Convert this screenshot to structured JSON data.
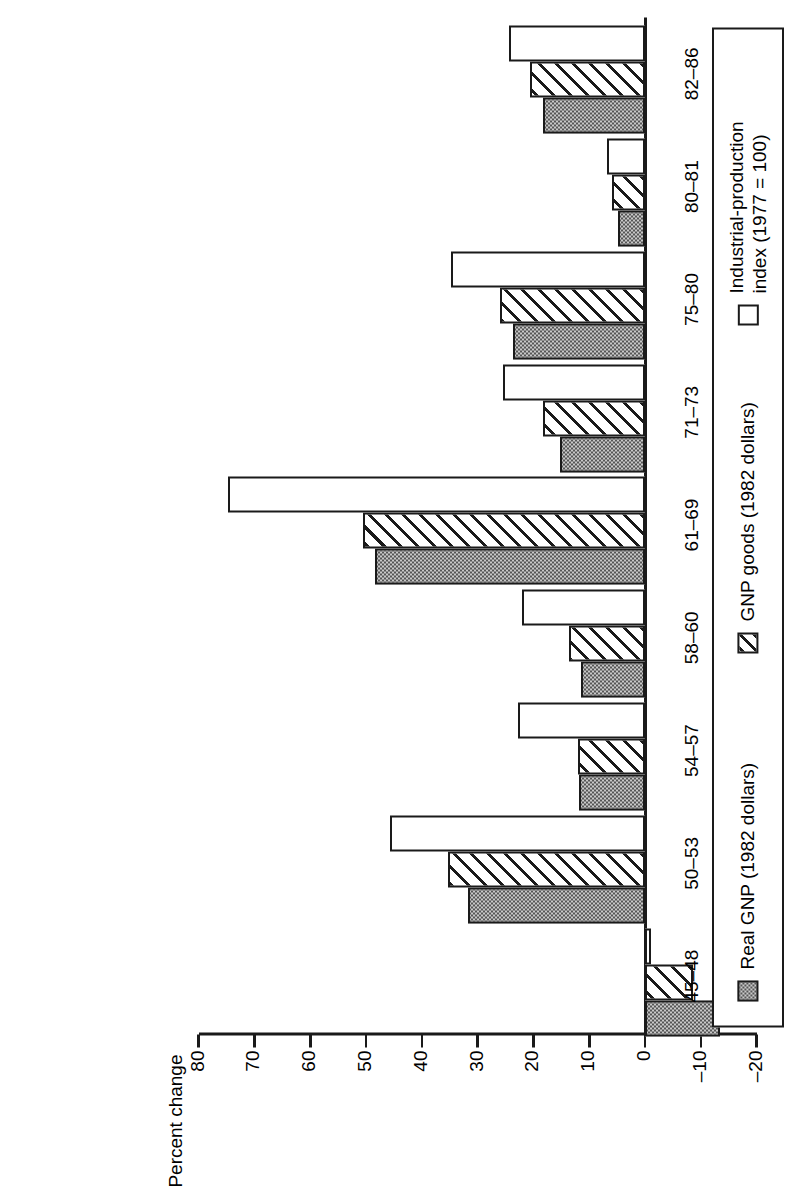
{
  "chart_data": {
    "type": "bar",
    "title": "",
    "xlabel": "",
    "ylabel": "Percent change",
    "orientation": "vertical-rotated",
    "grid": false,
    "legend_position": "right",
    "ylim": [
      -20,
      80
    ],
    "yticks": [
      80,
      70,
      60,
      50,
      40,
      30,
      20,
      10,
      0,
      "–10",
      "–20"
    ],
    "ytick_values": [
      80,
      70,
      60,
      50,
      40,
      30,
      20,
      10,
      0,
      -10,
      -20
    ],
    "categories": [
      "45–48",
      "50–53",
      "54–57",
      "58–60",
      "61–69",
      "71–73",
      "75–80",
      "80–81",
      "82–86"
    ],
    "series": [
      {
        "name": "Real GNP (1982 dollars)",
        "pattern": "dotted",
        "values": [
          -13.4,
          31.7,
          11.8,
          11.5,
          48.4,
          15.2,
          23.6,
          4.8,
          18.3
        ]
      },
      {
        "name": "GNP goods (1982 dollars)",
        "pattern": "hatched",
        "values": [
          -8.6,
          35.3,
          12.0,
          13.6,
          50.5,
          18.3,
          26.0,
          5.9,
          20.6
        ]
      },
      {
        "name": "Industrial-production index (1977 = 100)",
        "pattern": "white",
        "values": [
          -1.0,
          45.7,
          22.8,
          22.0,
          74.7,
          25.5,
          34.8,
          6.8,
          24.4
        ]
      }
    ]
  },
  "legend": {
    "items": [
      {
        "label": "Real GNP (1982 dollars)",
        "pattern": "dotted"
      },
      {
        "label": "GNP goods (1982 dollars)",
        "pattern": "hatched"
      },
      {
        "label": "Industrial-production\nindex (1977 = 100)",
        "pattern": "white"
      }
    ]
  },
  "axis": {
    "title": "Percent change"
  }
}
